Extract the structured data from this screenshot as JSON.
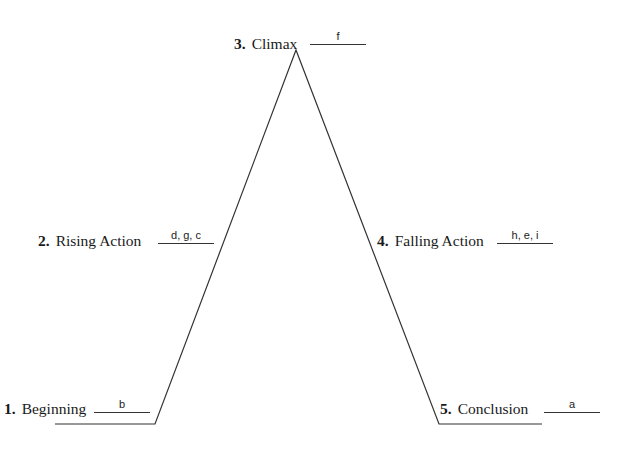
{
  "diagram": {
    "type": "plot-structure-triangle",
    "stages": [
      {
        "number": "1.",
        "label": "Beginning",
        "answer": "b"
      },
      {
        "number": "2.",
        "label": "Rising Action",
        "answer": "d, g, c"
      },
      {
        "number": "3.",
        "label": "Climax",
        "answer": "f"
      },
      {
        "number": "4.",
        "label": "Falling Action",
        "answer": "h, e, i"
      },
      {
        "number": "5.",
        "label": "Conclusion",
        "answer": "a"
      }
    ],
    "line_color": "#333333"
  }
}
